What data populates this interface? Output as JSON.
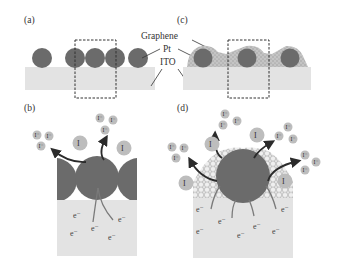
{
  "panels": {
    "a": {
      "label": "(a)"
    },
    "b": {
      "label": "(b)"
    },
    "c": {
      "label": "(c)"
    },
    "d": {
      "label": "(d)"
    }
  },
  "callouts": {
    "graphene": "Graphene",
    "pt": "Pt",
    "ito": "ITO"
  },
  "species": {
    "iodide": "I⁻",
    "triiodide_base": "I",
    "triiodide_sub": "3",
    "triiodide_sup": "−",
    "electron": "e⁻"
  },
  "colors": {
    "pt": "#6b6b6b",
    "ito": "#e3e3e3",
    "graphene": "#b9b9b9",
    "ion": "#bdbdbd",
    "arrow": "#2b2b2b",
    "dashed_box": "#333333"
  }
}
